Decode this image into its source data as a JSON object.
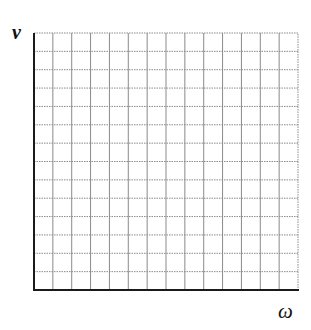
{
  "diagram": {
    "type": "blank_coordinate_grid",
    "y_axis_label": "v",
    "x_axis_label": "ω",
    "grid": {
      "columns": 14,
      "rows": 14,
      "origin_px": [
        34,
        290
      ],
      "top_right_px": [
        298,
        33
      ],
      "grid_color": "#8a8a8a",
      "axis_color": "#1a1a1a",
      "background": "#ffffff"
    }
  }
}
